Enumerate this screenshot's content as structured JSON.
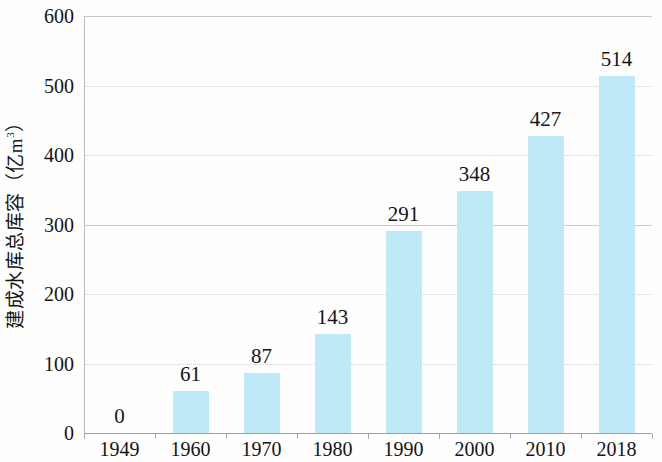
{
  "chart_data": {
    "type": "bar",
    "title": "",
    "subtitle": "",
    "xlabel": "",
    "ylabel": "建成水库总库容（亿m³）",
    "ylabel_prefix": "建成水库总库容（亿m",
    "ylabel_superscript": "3",
    "ylabel_suffix": "）",
    "categories": [
      "1949",
      "1960",
      "1970",
      "1980",
      "1990",
      "2000",
      "2010",
      "2018"
    ],
    "values": [
      0,
      61,
      87,
      143,
      291,
      348,
      427,
      514
    ],
    "data_labels": [
      "0",
      "61",
      "87",
      "143",
      "291",
      "348",
      "427",
      "514"
    ],
    "ylim": [
      0,
      600
    ],
    "ytick_labels": [
      "0",
      "100",
      "200",
      "300",
      "400",
      "500",
      "600"
    ],
    "ytick_values": [
      0,
      100,
      200,
      300,
      400,
      500,
      600
    ],
    "grid": true,
    "grid_axis": "y",
    "legend": false,
    "legend_position": "none",
    "bar_color": "#bfe9f7",
    "grid_color": "#cfcfcf",
    "axis_color": "#9f9f9f",
    "text_color": "#141414",
    "background_color": "#fefefe"
  }
}
